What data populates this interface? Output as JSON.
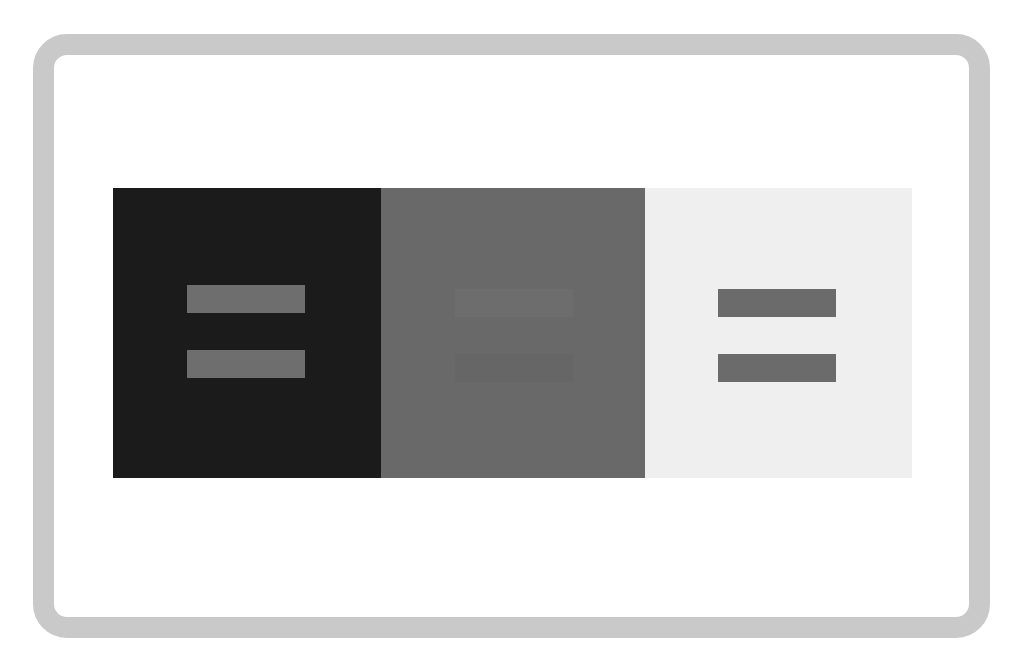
{
  "figure": {
    "frame_color": "#c9c9c9",
    "panels": [
      {
        "name": "dark",
        "background": "#1b1b1b",
        "bar_top": "#6e6e6e",
        "bar_bottom": "#6e6e6e"
      },
      {
        "name": "mid-gray",
        "background": "#696969",
        "bar_top": "#6d6d6d",
        "bar_bottom": "#666666"
      },
      {
        "name": "light",
        "background": "#efefef",
        "bar_top": "#6b6b6b",
        "bar_bottom": "#6b6b6b"
      }
    ]
  }
}
